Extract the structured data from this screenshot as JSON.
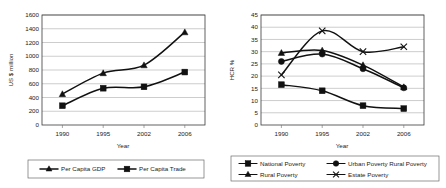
{
  "chart_data": [
    {
      "id": "left",
      "type": "line",
      "title": "",
      "xlabel": "Year",
      "ylabel": "US $ million",
      "categories": [
        "1990",
        "1995",
        "2002",
        "2006"
      ],
      "ylim": [
        0,
        1600
      ],
      "yticks": [
        0,
        200,
        400,
        600,
        800,
        1000,
        1200,
        1400,
        1600
      ],
      "grid": true,
      "legend_position": "bottom",
      "series": [
        {
          "name": "Per Capita GDP",
          "marker": "triangle",
          "values": [
            450,
            755,
            870,
            1350
          ]
        },
        {
          "name": "Per Capita Trade",
          "marker": "square",
          "values": [
            280,
            535,
            555,
            770
          ]
        }
      ]
    },
    {
      "id": "right",
      "type": "line",
      "title": "",
      "xlabel": "Year",
      "ylabel": "HCR %",
      "categories": [
        "1990",
        "1995",
        "2002",
        "2006"
      ],
      "ylim": [
        0,
        45
      ],
      "yticks": [
        0,
        5,
        10,
        15,
        20,
        25,
        30,
        35,
        40,
        45
      ],
      "grid": true,
      "legend_position": "bottom",
      "series": [
        {
          "name": "National Poverty",
          "marker": "square",
          "values": [
            16.5,
            14.0,
            7.9,
            6.7
          ]
        },
        {
          "name": "Urban Poverty Rural Poverty",
          "marker": "circle",
          "values": [
            26.0,
            29.0,
            23.0,
            15.2
          ]
        },
        {
          "name": "Rural Poverty",
          "marker": "triangle",
          "values": [
            29.5,
            30.5,
            24.5,
            15.5
          ]
        },
        {
          "name": "Estate Poverty",
          "marker": "x",
          "values": [
            20.5,
            38.5,
            30.0,
            32.0
          ]
        }
      ]
    }
  ],
  "colors": {
    "series": "#111111",
    "grid": "#9a9a9a",
    "frame": "#3b3b3b",
    "background": "#ffffff"
  }
}
